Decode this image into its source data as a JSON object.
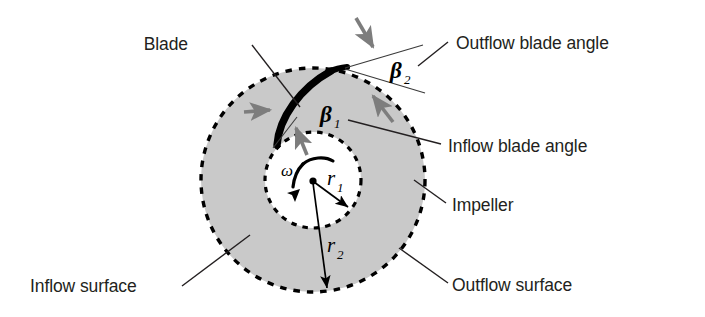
{
  "figure": {
    "type": "technical-diagram",
    "background_color": "#ffffff",
    "impeller_fill_color": "#c9c9c9",
    "blade_color": "#000000",
    "arrow_color": "#808080",
    "text_color": "#231f20"
  },
  "labels": {
    "blade": "Blade",
    "outflow_blade_angle": "Outflow blade angle",
    "inflow_blade_angle": "Inflow blade angle",
    "impeller": "Impeller",
    "inflow_surface": "Inflow surface",
    "outflow_surface": "Outflow surface"
  },
  "symbols": {
    "beta": "β",
    "beta1_sub": "1",
    "beta2_sub": "2",
    "omega": "ω",
    "r": "r",
    "r1_sub": "1",
    "r2_sub": "2"
  },
  "geometry": {
    "center_x": 313,
    "center_y": 180,
    "outer_radius": 112,
    "inner_radius": 48,
    "blade_tip_x": 347,
    "blade_tip_y": 68,
    "blade_root_x": 278,
    "blade_root_y": 143
  },
  "icons": {
    "flow_arrow": "gray-flow-arrow",
    "rotation_arrow": "omega-rotation-arrow",
    "radius_arrow": "radius-dimension-arrow"
  }
}
